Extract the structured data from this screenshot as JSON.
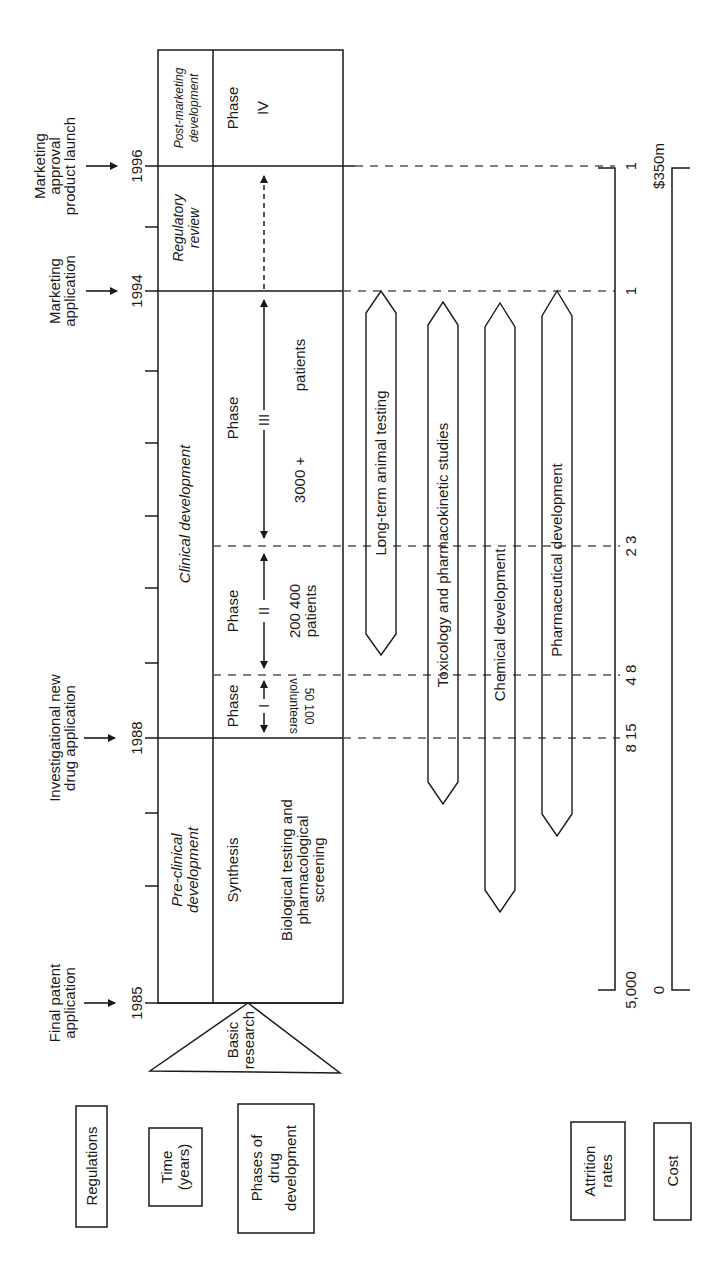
{
  "regulations": {
    "label": "Regulations",
    "events": [
      {
        "year": "1985",
        "lines": [
          "Final patent",
          "application"
        ]
      },
      {
        "year": "1988",
        "lines": [
          "Investigational new",
          "drug application"
        ]
      },
      {
        "year": "1994",
        "lines": [
          "Marketing",
          "application"
        ]
      },
      {
        "year": "1996",
        "lines": [
          "Marketing",
          "approval",
          "product launch"
        ]
      }
    ]
  },
  "time": {
    "label_line1": "Time",
    "label_line2": "(years)",
    "years": [
      "1985",
      "1988",
      "1994",
      "1996"
    ]
  },
  "phases": {
    "label_lines": [
      "Phases of",
      "drug",
      "development"
    ],
    "basic_research": [
      "Basic",
      "research"
    ],
    "preclinical": {
      "title": [
        "Pre-clinical",
        "development"
      ],
      "synthesis": "Synthesis",
      "screening": [
        "Biological testing and",
        "pharmacological",
        "screening"
      ]
    },
    "clinical": {
      "title": "Clinical development",
      "phase_word": "Phase",
      "phase1": {
        "numeral": "I",
        "subjects": "50 100",
        "subjects_unit": "volunteers"
      },
      "phase2": {
        "numeral": "II",
        "subjects": "200 400",
        "subjects_unit": "patients"
      },
      "phase3": {
        "numeral": "III",
        "subjects": "3000 +",
        "subjects_unit": "patients"
      }
    },
    "regulatory": {
      "title": [
        "Regulatory",
        "review"
      ]
    },
    "postmarketing": {
      "title": [
        "Post-marketing",
        "development"
      ],
      "phase": "Phase",
      "numeral": "IV"
    }
  },
  "parallel_activities": [
    "Long-term animal testing",
    "Toxicology and pharmacokinetic studies",
    "Chemical development",
    "Pharmaceutical development"
  ],
  "attrition": {
    "label_lines": [
      "Attrition",
      "rates"
    ],
    "start": "5,000",
    "values": [
      "8 15",
      "4 8",
      "2 3",
      "1",
      "1"
    ]
  },
  "cost": {
    "label": "Cost",
    "start": "0",
    "end": "$350m"
  }
}
